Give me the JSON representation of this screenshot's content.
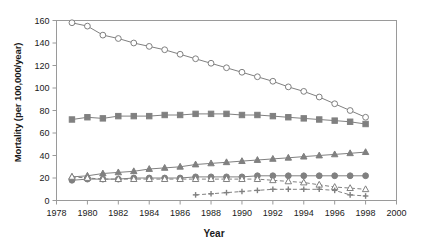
{
  "chart_data": {
    "type": "line",
    "title": "",
    "xlabel": "Year",
    "ylabel": "Mortality (per 100,000/year)",
    "xlim": [
      1978,
      2000
    ],
    "ylim": [
      0,
      160
    ],
    "xticks": [
      1978,
      1980,
      1982,
      1984,
      1986,
      1988,
      1990,
      1992,
      1994,
      1996,
      1998,
      2000
    ],
    "yticks": [
      0,
      20,
      40,
      60,
      80,
      100,
      120,
      140,
      160
    ],
    "grid": false,
    "legend": "none",
    "series": [
      {
        "name": "series-open-circle",
        "marker": "open-circle",
        "line": "solid",
        "color": "#808080",
        "x": [
          1979,
          1980,
          1981,
          1982,
          1983,
          1984,
          1985,
          1986,
          1987,
          1988,
          1989,
          1990,
          1991,
          1992,
          1993,
          1994,
          1995,
          1996,
          1997,
          1998
        ],
        "values": [
          158,
          155,
          147,
          144,
          140,
          137,
          134,
          130,
          126,
          122,
          118,
          114,
          110,
          106,
          101,
          97,
          92,
          86,
          80,
          74
        ]
      },
      {
        "name": "series-filled-square",
        "marker": "filled-square",
        "line": "solid",
        "color": "#808080",
        "x": [
          1979,
          1980,
          1981,
          1982,
          1983,
          1984,
          1985,
          1986,
          1987,
          1988,
          1989,
          1990,
          1991,
          1992,
          1993,
          1994,
          1995,
          1996,
          1997,
          1998
        ],
        "values": [
          72,
          74,
          73,
          75,
          75,
          75,
          76,
          76,
          77,
          77,
          77,
          76,
          76,
          75,
          74,
          73,
          72,
          71,
          70,
          68
        ]
      },
      {
        "name": "series-filled-triangle",
        "marker": "filled-triangle",
        "line": "solid",
        "color": "#808080",
        "x": [
          1979,
          1980,
          1981,
          1982,
          1983,
          1984,
          1985,
          1986,
          1987,
          1988,
          1989,
          1990,
          1991,
          1992,
          1993,
          1994,
          1995,
          1996,
          1997,
          1998
        ],
        "values": [
          21,
          22,
          24,
          25,
          26,
          28,
          29,
          30,
          32,
          33,
          34,
          35,
          36,
          37,
          38,
          39,
          40,
          41,
          42,
          43
        ]
      },
      {
        "name": "series-filled-circle",
        "marker": "filled-circle",
        "line": "solid",
        "color": "#808080",
        "x": [
          1979,
          1980,
          1981,
          1982,
          1983,
          1984,
          1985,
          1986,
          1987,
          1988,
          1989,
          1990,
          1991,
          1992,
          1993,
          1994,
          1995,
          1996,
          1997,
          1998
        ],
        "values": [
          18,
          19,
          19,
          19,
          20,
          20,
          20,
          20,
          21,
          21,
          21,
          21,
          22,
          22,
          22,
          22,
          22,
          22,
          22,
          22
        ]
      },
      {
        "name": "series-open-triangle",
        "marker": "open-triangle",
        "line": "dashed",
        "color": "#808080",
        "x": [
          1979,
          1980,
          1981,
          1982,
          1983,
          1984,
          1985,
          1986,
          1987,
          1988,
          1989,
          1990,
          1991,
          1992,
          1993,
          1994,
          1995,
          1996,
          1997,
          1998
        ],
        "values": [
          21,
          20,
          19,
          19,
          19,
          19,
          19,
          19,
          19,
          19,
          19,
          19,
          19,
          18,
          17,
          16,
          14,
          12,
          11,
          10
        ]
      },
      {
        "name": "series-cross",
        "marker": "cross",
        "line": "dashed",
        "color": "#808080",
        "x": [
          1987,
          1988,
          1989,
          1990,
          1991,
          1992,
          1993,
          1994,
          1995,
          1996,
          1997,
          1998
        ],
        "values": [
          5,
          6,
          7,
          8,
          9,
          10,
          10,
          10,
          10,
          9,
          5,
          4
        ]
      }
    ]
  },
  "axis": {
    "ylabel": "Mortality (per 100,000/year)",
    "xlabel": "Year"
  }
}
